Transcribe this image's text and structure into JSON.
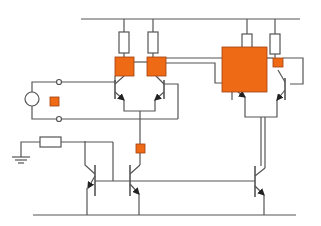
{
  "diagram": {
    "type": "transistor-circuit-schematic",
    "colors": {
      "wire": "#555555",
      "highlight": "#ef6a14",
      "highlight_border": "#a04010",
      "background": "#ffffff"
    },
    "components": {
      "resistors": [
        {
          "id": "r1",
          "x": 119,
          "y": 32,
          "w": 10,
          "h": 21
        },
        {
          "id": "r2",
          "x": 148,
          "y": 32,
          "w": 10,
          "h": 21
        },
        {
          "id": "r3",
          "x": 242,
          "y": 34,
          "w": 10,
          "h": 14
        },
        {
          "id": "r4",
          "x": 270,
          "y": 34,
          "w": 10,
          "h": 20
        },
        {
          "id": "r-ground",
          "x": 40,
          "y": 137,
          "w": 21,
          "h": 10
        }
      ],
      "highlight_blocks": [
        {
          "id": "block-q1",
          "x": 115,
          "y": 57,
          "w": 19,
          "h": 19
        },
        {
          "id": "block-q2",
          "x": 147,
          "y": 57,
          "w": 19,
          "h": 19
        },
        {
          "id": "block-large",
          "x": 222,
          "y": 47,
          "w": 45,
          "h": 45
        },
        {
          "id": "block-small-right",
          "x": 273,
          "y": 58,
          "w": 10,
          "h": 9
        },
        {
          "id": "block-input",
          "x": 50,
          "y": 97,
          "w": 9,
          "h": 9
        },
        {
          "id": "block-tail",
          "x": 136,
          "y": 144,
          "w": 9,
          "h": 9
        }
      ],
      "source": {
        "cx": 32,
        "cy": 99,
        "r": 7
      },
      "terminals": [
        {
          "cx": 59,
          "cy": 82,
          "r": 2.5
        },
        {
          "cx": 59,
          "cy": 119,
          "r": 2.5
        }
      ]
    }
  }
}
